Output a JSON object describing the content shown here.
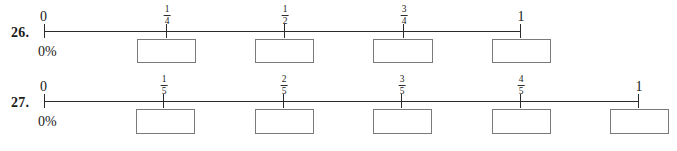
{
  "page": {
    "background": "#ffffff",
    "line_color": "#2b2b2b",
    "box_border_color": "#7a7a7a"
  },
  "problems": [
    {
      "number": "26.",
      "start_label": "0",
      "percent_label": "0%",
      "end_label": "1",
      "ticks": [
        {
          "label_type": "whole",
          "text": "0",
          "value": "0"
        },
        {
          "label_type": "fraction",
          "numerator": "1",
          "denominator": "4",
          "value": "1/4"
        },
        {
          "label_type": "fraction",
          "numerator": "1",
          "denominator": "2",
          "value": "1/2"
        },
        {
          "label_type": "fraction",
          "numerator": "3",
          "denominator": "4",
          "value": "3/4"
        },
        {
          "label_type": "whole",
          "text": "1",
          "value": "1"
        }
      ],
      "answer_boxes": [
        {
          "value": "",
          "placeholder": ""
        },
        {
          "value": "",
          "placeholder": ""
        },
        {
          "value": "",
          "placeholder": ""
        },
        {
          "value": "",
          "placeholder": ""
        }
      ]
    },
    {
      "number": "27.",
      "start_label": "0",
      "percent_label": "0%",
      "end_label": "1",
      "ticks": [
        {
          "label_type": "whole",
          "text": "0",
          "value": "0"
        },
        {
          "label_type": "fraction",
          "numerator": "1",
          "denominator": "5",
          "value": "1/5"
        },
        {
          "label_type": "fraction",
          "numerator": "2",
          "denominator": "5",
          "value": "2/5"
        },
        {
          "label_type": "fraction",
          "numerator": "3",
          "denominator": "5",
          "value": "3/5"
        },
        {
          "label_type": "fraction",
          "numerator": "4",
          "denominator": "5",
          "value": "4/5"
        },
        {
          "label_type": "whole",
          "text": "1",
          "value": "1"
        }
      ],
      "answer_boxes": [
        {
          "value": "",
          "placeholder": ""
        },
        {
          "value": "",
          "placeholder": ""
        },
        {
          "value": "",
          "placeholder": ""
        },
        {
          "value": "",
          "placeholder": ""
        },
        {
          "value": "",
          "placeholder": ""
        }
      ]
    }
  ]
}
